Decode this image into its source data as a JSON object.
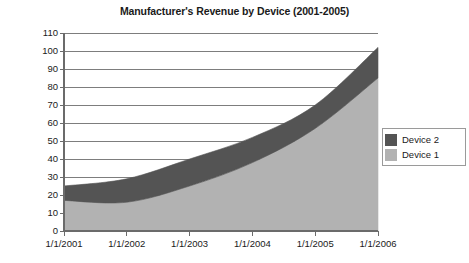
{
  "chart_data": {
    "type": "area",
    "stacked": true,
    "title": "Manufacturer's Revenue by Device (2001-2005)",
    "xlabel": "",
    "ylabel": "Reenues ($M)",
    "categories": [
      "1/1/2001",
      "1/1/2002",
      "1/1/2003",
      "1/1/2004",
      "1/1/2005",
      "1/1/2006"
    ],
    "x_tick_labels": [
      "1/1/2001",
      "1/1/2002",
      "1/1/2003",
      "1/1/2004",
      "1/1/2005",
      "1/1/2006"
    ],
    "y_tick_labels": [
      "110",
      "100",
      "90",
      "80",
      "70",
      "60",
      "50",
      "40",
      "30",
      "20",
      "10",
      "0"
    ],
    "ylim": [
      0,
      110
    ],
    "y_step": 10,
    "grid": true,
    "grid_axis": "y",
    "legend_position": "right",
    "series": [
      {
        "name": "Device 1",
        "color": "#b2b2b2",
        "values": [
          17,
          16,
          25,
          38,
          57,
          85
        ]
      },
      {
        "name": "Device 2",
        "color": "#545454",
        "values": [
          8,
          13,
          15,
          14,
          13,
          17
        ]
      }
    ],
    "cumulative_tops": {
      "Device 1": [
        17,
        16,
        25,
        38,
        57,
        85
      ],
      "Device 2": [
        25,
        29,
        40,
        52,
        70,
        102
      ]
    }
  },
  "legend": {
    "entries": [
      {
        "label": "Device 2",
        "color": "#545454"
      },
      {
        "label": "Device 1",
        "color": "#b2b2b2"
      }
    ]
  },
  "colors": {
    "device1": "#b2b2b2",
    "device2": "#545454",
    "axis": "#6b6b6b",
    "grid": "#7d7d7d",
    "text": "#1a1a1a"
  }
}
